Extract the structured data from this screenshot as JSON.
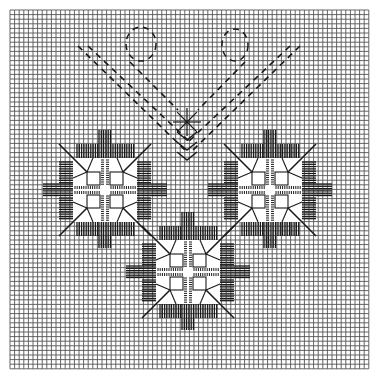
{
  "chart": {
    "kind": "embroidery-stitch-chart",
    "grid": {
      "x0": 10,
      "y0": 10,
      "cols": 78,
      "rows": 78,
      "cell": 4.6,
      "line_color": "#555555",
      "line_width": 0.9,
      "background": "#ffffff"
    },
    "colors": {
      "stitch": "#1a1a1a",
      "block_fill": "#ffffff"
    },
    "motifs": [
      {
        "name": "left-square-motif",
        "cx": 105,
        "cy": 190
      },
      {
        "name": "right-square-motif",
        "cx": 270,
        "cy": 190
      },
      {
        "name": "bottom-square-motif",
        "cx": 188,
        "cy": 272
      }
    ],
    "motif_spec": {
      "inner_half": 18,
      "outer_half": 32,
      "diag_len": 46,
      "arm_len": 32,
      "arm_span": 30,
      "arm_step": 2.3
    },
    "dashed_lines": [
      {
        "name": "v-line-left-outer",
        "x1": 78,
        "y1": 46,
        "x2": 185,
        "y2": 150
      },
      {
        "name": "v-line-left-inner",
        "x1": 88,
        "y1": 46,
        "x2": 190,
        "y2": 142
      },
      {
        "name": "v-line-right-outer",
        "x1": 300,
        "y1": 46,
        "x2": 193,
        "y2": 150
      },
      {
        "name": "v-line-right-inner",
        "x1": 290,
        "y1": 46,
        "x2": 188,
        "y2": 142
      },
      {
        "name": "stem-left-loop",
        "x1": 130,
        "y1": 62,
        "x2": 178,
        "y2": 110
      },
      {
        "name": "stem-right-loop",
        "x1": 245,
        "y1": 62,
        "x2": 198,
        "y2": 110
      }
    ],
    "loops": [
      {
        "name": "left-loop",
        "cx": 141,
        "cy": 44,
        "rx": 15,
        "ry": 17
      },
      {
        "name": "right-loop",
        "cx": 235,
        "cy": 45,
        "rx": 13,
        "ry": 16
      }
    ],
    "star": {
      "name": "center-eyelet-star",
      "cx": 187,
      "cy": 122,
      "r": 14
    },
    "chevrons": [
      {
        "cx": 187,
        "cy": 136,
        "w": 10,
        "h": 8
      },
      {
        "cx": 187,
        "cy": 146,
        "w": 10,
        "h": 8
      },
      {
        "cx": 187,
        "cy": 156,
        "w": 10,
        "h": 8
      }
    ]
  }
}
